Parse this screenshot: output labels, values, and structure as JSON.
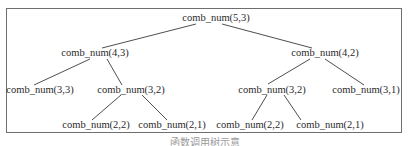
{
  "diagram": {
    "caption": "函数调用树示意",
    "colors": {
      "frame": "#6e6e6e",
      "edge": "#3a3a3a",
      "text": "#2a2a2a"
    },
    "nodes": [
      {
        "id": "n53",
        "label": "comb_num(5,3)",
        "x": 216,
        "y": 18
      },
      {
        "id": "n43",
        "label": "comb_num(4,3)",
        "x": 95,
        "y": 53
      },
      {
        "id": "n42",
        "label": "comb_num(4,2)",
        "x": 325,
        "y": 53
      },
      {
        "id": "n33",
        "label": "comb_num(3,3)",
        "x": 40,
        "y": 90
      },
      {
        "id": "n32a",
        "label": "comb_num(3,2)",
        "x": 131,
        "y": 90
      },
      {
        "id": "n32b",
        "label": "comb_num(3,2)",
        "x": 272,
        "y": 90
      },
      {
        "id": "n31",
        "label": "comb_num(3,1)",
        "x": 366,
        "y": 90
      },
      {
        "id": "n22a",
        "label": "comb_num(2,2)",
        "x": 96,
        "y": 125
      },
      {
        "id": "n21a",
        "label": "comb_num(2,1)",
        "x": 172,
        "y": 125
      },
      {
        "id": "n22b",
        "label": "comb_num(2,2)",
        "x": 250,
        "y": 125
      },
      {
        "id": "n21b",
        "label": "comb_num(2,1)",
        "x": 330,
        "y": 125
      }
    ],
    "edges": [
      {
        "from": "n53",
        "to": "n43"
      },
      {
        "from": "n53",
        "to": "n42"
      },
      {
        "from": "n43",
        "to": "n33"
      },
      {
        "from": "n43",
        "to": "n32a"
      },
      {
        "from": "n42",
        "to": "n32b"
      },
      {
        "from": "n42",
        "to": "n31"
      },
      {
        "from": "n32a",
        "to": "n22a"
      },
      {
        "from": "n32a",
        "to": "n21a"
      },
      {
        "from": "n32b",
        "to": "n22b"
      },
      {
        "from": "n32b",
        "to": "n21b"
      }
    ]
  }
}
